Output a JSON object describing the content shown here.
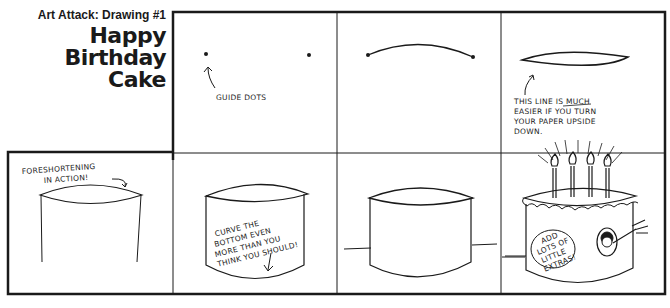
{
  "header": {
    "series_label": "Art Attack: Drawing #1",
    "title_lines": [
      "Happy",
      "Birthday",
      "Cake"
    ]
  },
  "panels": [
    {
      "step": 1,
      "caption_lines": [
        "GUIDE DOTS"
      ]
    },
    {
      "step": 2,
      "caption_lines": []
    },
    {
      "step": 3,
      "caption_lines": [
        "THIS LINE IS MUCH",
        "EASIER IF YOU TURN",
        "YOUR PAPER UPSIDE",
        "DOWN."
      ],
      "emphasis_word": "MUCH"
    },
    {
      "step": 4,
      "caption_lines": [
        "FORESHORTENING",
        "IN ACTION!"
      ]
    },
    {
      "step": 5,
      "caption_lines": [
        "CURVE THE",
        "BOTTOM EVEN",
        "MORE THAN YOU",
        "THINK YOU SHOULD!"
      ]
    },
    {
      "step": 6,
      "caption_lines": []
    },
    {
      "step": 7,
      "caption_lines": [
        "ADD",
        "LOTS OF",
        "LITTLE",
        "EXTRAS!"
      ],
      "candles": 4
    }
  ],
  "colors": {
    "ink": "#1a1a1a",
    "paper": "#ffffff"
  }
}
